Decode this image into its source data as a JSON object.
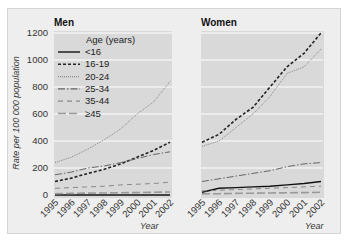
{
  "chart_data": {
    "type": "line",
    "ylabel": "Rate per 100 000 population",
    "xlabel": "Year",
    "ylim": [
      0,
      1200
    ],
    "yticks": [
      0,
      200,
      400,
      600,
      800,
      1000,
      1200
    ],
    "x": [
      "1995",
      "1996",
      "1997",
      "1998",
      "1999",
      "2000",
      "2001",
      "2002"
    ],
    "grid": true,
    "legend": {
      "title": "Age (years)",
      "position": "upper-left of Men panel",
      "entries": [
        "<16",
        "16-19",
        "20-24",
        "25-34",
        "35-44",
        "≥45"
      ]
    },
    "panels": [
      {
        "title": "Men",
        "series": [
          {
            "name": "<16",
            "values": [
              0,
              0,
              0,
              0,
              0,
              0,
              0,
              0
            ]
          },
          {
            "name": "16-19",
            "values": [
              100,
              125,
              160,
              190,
              230,
              280,
              330,
              390
            ]
          },
          {
            "name": "20-24",
            "values": [
              240,
              280,
              340,
              410,
              490,
              600,
              690,
              840
            ]
          },
          {
            "name": "25-34",
            "values": [
              150,
              170,
              200,
              215,
              240,
              270,
              300,
              320
            ]
          },
          {
            "name": "35-44",
            "values": [
              50,
              55,
              60,
              65,
              75,
              80,
              85,
              95
            ]
          },
          {
            "name": "≥45",
            "values": [
              10,
              12,
              14,
              15,
              17,
              18,
              20,
              22
            ]
          }
        ]
      },
      {
        "title": "Women",
        "series": [
          {
            "name": "<16",
            "values": [
              20,
              50,
              55,
              60,
              65,
              75,
              85,
              100
            ]
          },
          {
            "name": "16-19",
            "values": [
              390,
              450,
              560,
              650,
              800,
              950,
              1050,
              1200
            ]
          },
          {
            "name": "20-24",
            "values": [
              360,
              400,
              500,
              600,
              730,
              900,
              950,
              1080
            ]
          },
          {
            "name": "25-34",
            "values": [
              100,
              120,
              140,
              160,
              180,
              210,
              230,
              240
            ]
          },
          {
            "name": "35-44",
            "values": [
              30,
              35,
              40,
              45,
              50,
              55,
              60,
              65
            ]
          },
          {
            "name": "≥45",
            "values": [
              8,
              10,
              12,
              13,
              15,
              17,
              18,
              20
            ]
          }
        ]
      }
    ]
  },
  "styles": {
    "plot_bg": "#d9d9d9",
    "grid_color": "#ffffff",
    "series": {
      "<16": {
        "color": "#111111",
        "dash": "",
        "width": 1.4
      },
      "16-19": {
        "color": "#222222",
        "dash": "3,2",
        "width": 1.6
      },
      "20-24": {
        "color": "#888888",
        "dash": "1,1",
        "width": 1
      },
      "25-34": {
        "color": "#666666",
        "dash": "7,2,1.5,2",
        "width": 1
      },
      "35-44": {
        "color": "#888888",
        "dash": "5,4",
        "width": 1
      },
      "≥45": {
        "color": "#999999",
        "dash": "8,3",
        "width": 1.6
      }
    }
  }
}
